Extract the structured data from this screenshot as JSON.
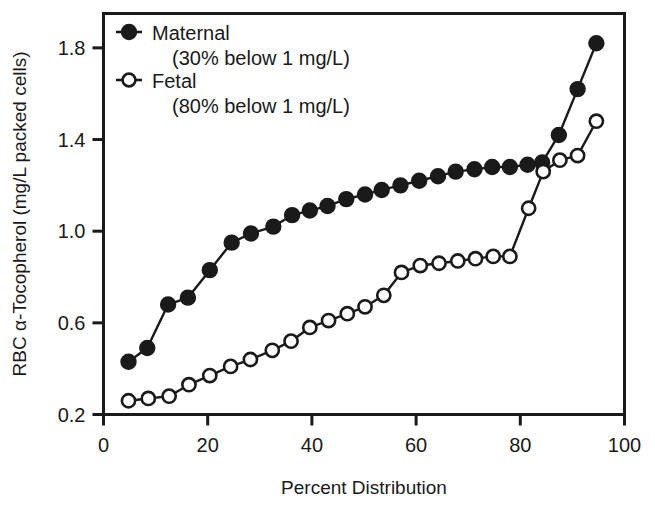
{
  "chart_data": {
    "type": "line",
    "title": "",
    "xlabel": "Percent Distribution",
    "ylabel": "RBC α-Tocopherol (mg/L packed cells)",
    "xlim": [
      0,
      100
    ],
    "ylim": [
      0.2,
      1.95
    ],
    "xticks": [
      0,
      20,
      40,
      60,
      80,
      100
    ],
    "xtick_labels": [
      "0",
      "20",
      "40",
      "60",
      "80",
      "100"
    ],
    "yticks": [
      0.2,
      0.6,
      1.0,
      1.4,
      1.8
    ],
    "ytick_labels": [
      "0.2",
      "0.6",
      "1.0",
      "1.4",
      "1.8"
    ],
    "grid": false,
    "legend_position": "top-left",
    "series": [
      {
        "name": "Maternal",
        "legend_label": "Maternal",
        "legend_sublabel": "(30% below 1 mg/L)",
        "marker": "filled-circle",
        "color": "#1a1a1a",
        "x": [
          4.8,
          8.4,
          12.4,
          16.2,
          20.4,
          24.6,
          28.3,
          32.6,
          36.2,
          39.6,
          43.0,
          46.6,
          50.2,
          53.4,
          57.0,
          60.6,
          64.2,
          67.6,
          71.2,
          74.6,
          78.0,
          81.4,
          84.2,
          87.4,
          91.0,
          94.6
        ],
        "y": [
          0.43,
          0.49,
          0.68,
          0.71,
          0.83,
          0.95,
          0.99,
          1.02,
          1.07,
          1.09,
          1.11,
          1.14,
          1.16,
          1.18,
          1.2,
          1.22,
          1.24,
          1.26,
          1.27,
          1.28,
          1.28,
          1.29,
          1.3,
          1.42,
          1.62,
          1.82
        ]
      },
      {
        "name": "Fetal",
        "legend_label": "Fetal",
        "legend_sublabel": "(80% below 1 mg/L)",
        "marker": "open-circle",
        "color": "#1a1a1a",
        "x": [
          4.8,
          8.6,
          12.6,
          16.4,
          20.4,
          24.4,
          28.2,
          32.4,
          36.0,
          39.6,
          43.2,
          46.8,
          50.2,
          53.8,
          57.2,
          60.8,
          64.4,
          68.0,
          71.4,
          74.8,
          78.0,
          81.6,
          84.4,
          87.6,
          91.0,
          94.6
        ],
        "y": [
          0.26,
          0.27,
          0.28,
          0.33,
          0.37,
          0.41,
          0.44,
          0.48,
          0.52,
          0.58,
          0.61,
          0.64,
          0.67,
          0.72,
          0.82,
          0.85,
          0.86,
          0.87,
          0.88,
          0.89,
          0.89,
          1.1,
          1.26,
          1.31,
          1.33,
          1.48
        ]
      }
    ]
  }
}
